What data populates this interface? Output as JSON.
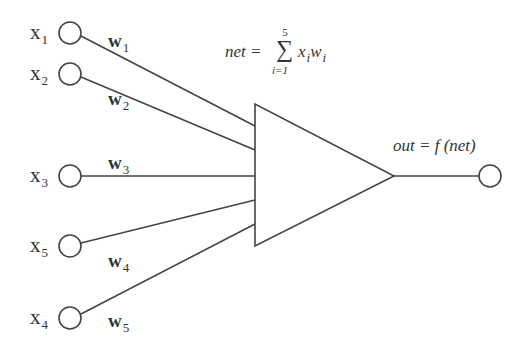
{
  "diagram": {
    "inputs": [
      {
        "label": "x",
        "sub": "1",
        "cy": 33,
        "weight": "w",
        "wsub": "1",
        "wx": 108,
        "wy": 30
      },
      {
        "label": "x",
        "sub": "2",
        "cy": 74,
        "weight": "w",
        "wsub": "2",
        "wx": 108,
        "wy": 88
      },
      {
        "label": "x",
        "sub": "3",
        "cy": 176,
        "weight": "w",
        "wsub": "3",
        "wx": 108,
        "wy": 156
      },
      {
        "label": "x",
        "sub": "5",
        "cy": 246,
        "weight": "w",
        "wsub": "4",
        "wx": 108,
        "wy": 252
      },
      {
        "label": "x",
        "sub": "4",
        "cy": 318,
        "weight": "w",
        "wsub": "5",
        "wx": 108,
        "wy": 312
      }
    ],
    "net_equation": {
      "lhs": "net =",
      "sigma": "∑",
      "upper": "5",
      "lower": "i=1",
      "term_x": "x",
      "term_w": "w",
      "index": "i"
    },
    "output_equation": "out = f (net)",
    "colors": {
      "stroke": "#444444",
      "text": "#333333"
    }
  }
}
